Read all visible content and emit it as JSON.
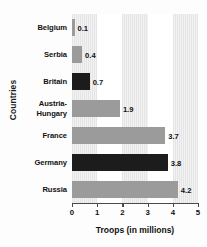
{
  "chart_data": {
    "type": "bar",
    "orientation": "horizontal",
    "title": "",
    "xlabel": "Troops (in millions)",
    "ylabel": "Countries",
    "categories": [
      "Belgium",
      "Serbia",
      "Britain",
      "Austria-Hungary",
      "France",
      "Germany",
      "Russia"
    ],
    "values": [
      0.1,
      0.4,
      0.7,
      1.9,
      3.7,
      3.8,
      4.2
    ],
    "value_labels": [
      "0.1",
      "0.4",
      "0.7",
      "1.9",
      "3.7",
      "3.8",
      "4.2"
    ],
    "bar_colors": [
      "#9b9b9b",
      "#9b9b9b",
      "#1c1c1c",
      "#9b9b9b",
      "#9b9b9b",
      "#1c1c1c",
      "#9b9b9b"
    ],
    "xlim": [
      0,
      5
    ],
    "xticks": [
      0,
      1,
      2,
      3,
      4,
      5
    ],
    "xtick_labels": [
      "0",
      "1",
      "2",
      "3",
      "4",
      "5"
    ],
    "grid": "alternating-vertical-bands",
    "legend": null,
    "colors": {
      "bar_gray": "#9b9b9b",
      "bar_dark": "#1c1c1c",
      "band": "#f2f2f2",
      "axis": "#4a4a4a",
      "text": "#111111"
    }
  },
  "axis": {
    "y_title": "Countries",
    "x_title": "Troops (in millions)"
  }
}
